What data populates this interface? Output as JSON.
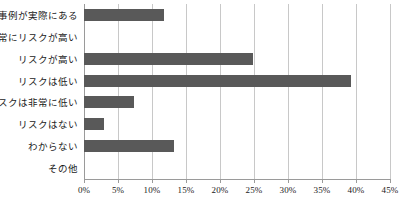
{
  "chart_data": {
    "type": "bar",
    "orientation": "horizontal",
    "title": "",
    "subtitle": "",
    "xlabel": "",
    "ylabel": "",
    "xlim": [
      0,
      45
    ],
    "ylim": null,
    "grid": "vertical",
    "legend": "none",
    "bar_color": "#595959",
    "gridline_color": "#c8c8c8",
    "axis_color": "#9a9a9a",
    "categories": [
      "事例が実際にある",
      "非常にリスクが高い",
      "リスクが高い",
      "リスクは低い",
      "リスクは非常に低い",
      "リスクはない",
      "わからない",
      "その他"
    ],
    "values": [
      11.7,
      0,
      24.9,
      39.3,
      7.3,
      3.0,
      13.3,
      0
    ],
    "x_ticks": [
      0,
      5,
      10,
      15,
      20,
      25,
      30,
      35,
      40,
      45
    ],
    "x_tick_labels": [
      "0%",
      "5%",
      "10%",
      "15%",
      "20%",
      "25%",
      "30%",
      "35%",
      "40%",
      "45%"
    ]
  }
}
